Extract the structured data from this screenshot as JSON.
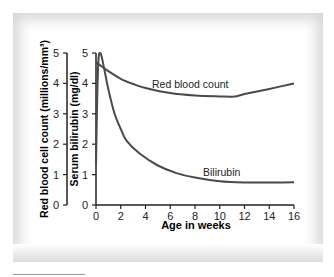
{
  "chart_data": {
    "type": "line",
    "title": "",
    "xlabel": "Age in weeks",
    "ylabel": "Red blood cell count (millions/mm³)",
    "ylabel2": "Serum bilirubin (mg/dl)",
    "xlim": [
      0,
      16
    ],
    "ylim": [
      0,
      5
    ],
    "ylim2": [
      0,
      5
    ],
    "x_ticks": [
      "0",
      "2",
      "4",
      "6",
      "8",
      "10",
      "12",
      "14",
      "16"
    ],
    "y_ticks": [
      "0",
      "1",
      "2",
      "3",
      "4",
      "5"
    ],
    "y2_ticks": [
      "0",
      "1",
      "2",
      "3",
      "4",
      "5"
    ],
    "grid": false,
    "legend": "inline labels",
    "series": [
      {
        "name": "Red blood count",
        "axis": "left",
        "x": [
          0,
          0.5,
          1,
          2,
          3,
          4,
          6,
          8,
          10,
          11.2,
          12,
          14,
          16
        ],
        "y": [
          4.7,
          4.55,
          4.4,
          4.15,
          3.98,
          3.85,
          3.68,
          3.6,
          3.57,
          3.57,
          3.65,
          3.82,
          4.0
        ]
      },
      {
        "name": "Bilirubin",
        "axis": "right",
        "x": [
          0,
          0.1,
          0.2,
          0.35,
          0.5,
          0.8,
          1,
          1.5,
          2,
          2.5,
          3.5,
          5,
          6.5,
          8,
          10,
          12,
          14,
          16
        ],
        "y": [
          1.3,
          3.5,
          4.8,
          5.0,
          4.8,
          4.2,
          3.8,
          3.0,
          2.5,
          2.1,
          1.7,
          1.3,
          1.05,
          0.9,
          0.78,
          0.74,
          0.74,
          0.75
        ]
      }
    ],
    "annotations": [
      {
        "text": "Red blood count",
        "x": 4.5,
        "y": 3.95
      },
      {
        "text": "Bilirubin",
        "x": 8.6,
        "y": 1.08
      }
    ]
  },
  "labels": {
    "rbc_axis": "Red blood cell count (millions/mm³)",
    "bili_axis": "Serum bilirubin (mg/dl)",
    "x_axis": "Age in weeks",
    "rbc_series": "Red blood count",
    "bili_series": "Bilirubin"
  },
  "colors": {
    "line": "#4a4a4a",
    "axis": "#222222",
    "text": "#222222"
  }
}
